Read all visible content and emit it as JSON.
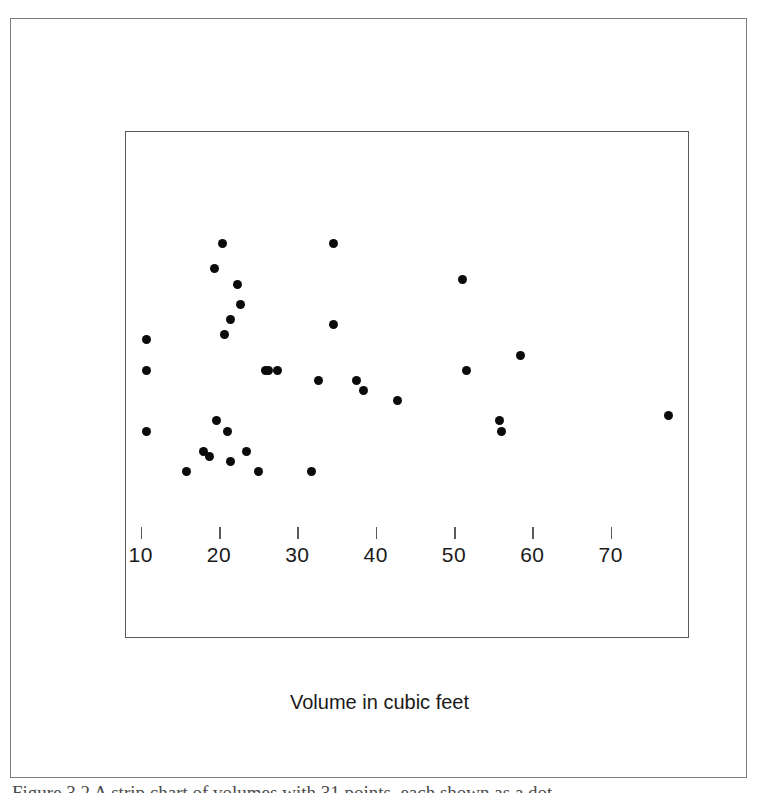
{
  "figure": {
    "caption": "Figure 3.2  A strip chart of volumes with 31 points, each shown as a dot."
  },
  "chart_data": {
    "type": "scatter",
    "title": "",
    "subtitle": "",
    "xlabel": "Volume in cubic feet",
    "ylabel": "",
    "xlim": [
      8,
      80
    ],
    "ylim": [
      0,
      1
    ],
    "grid": false,
    "legend": null,
    "xticks": [
      10,
      20,
      30,
      40,
      50,
      60,
      70
    ],
    "xticklabels": [
      "10",
      "20",
      "30",
      "40",
      "50",
      "60",
      "70"
    ],
    "yticks": [],
    "yticklabels": [],
    "marker": "filled-circle",
    "marker_color": "#0b0b0b",
    "marker_size_px": 9,
    "point_count": 31,
    "x": [
      10.6,
      10.6,
      10.6,
      15.7,
      17.9,
      18.7,
      19.3,
      19.6,
      20.3,
      20.6,
      21.0,
      21.4,
      21.4,
      22.2,
      22.6,
      23.4,
      24.9,
      25.8,
      26.2,
      27.4,
      31.7,
      32.6,
      34.5,
      34.5,
      37.4,
      38.3,
      42.6,
      51.0,
      51.5,
      55.7,
      55.9,
      58.3,
      77.3
    ],
    "jitter_y": [
      0.59,
      0.53,
      0.41,
      0.33,
      0.37,
      0.36,
      0.73,
      0.43,
      0.78,
      0.6,
      0.41,
      0.35,
      0.63,
      0.7,
      0.66,
      0.37,
      0.33,
      0.53,
      0.53,
      0.53,
      0.33,
      0.51,
      0.78,
      0.62,
      0.51,
      0.49,
      0.47,
      0.71,
      0.53,
      0.43,
      0.41,
      0.56,
      0.44
    ],
    "points": [
      {
        "x": 10.6,
        "y": 0.59
      },
      {
        "x": 10.6,
        "y": 0.53
      },
      {
        "x": 10.6,
        "y": 0.41
      },
      {
        "x": 15.7,
        "y": 0.33
      },
      {
        "x": 17.9,
        "y": 0.37
      },
      {
        "x": 18.7,
        "y": 0.36
      },
      {
        "x": 19.3,
        "y": 0.73
      },
      {
        "x": 19.6,
        "y": 0.43
      },
      {
        "x": 20.3,
        "y": 0.78
      },
      {
        "x": 20.6,
        "y": 0.6
      },
      {
        "x": 21.0,
        "y": 0.41
      },
      {
        "x": 21.4,
        "y": 0.35
      },
      {
        "x": 21.4,
        "y": 0.63
      },
      {
        "x": 22.2,
        "y": 0.7
      },
      {
        "x": 22.6,
        "y": 0.66
      },
      {
        "x": 23.4,
        "y": 0.37
      },
      {
        "x": 24.9,
        "y": 0.33
      },
      {
        "x": 25.8,
        "y": 0.53
      },
      {
        "x": 26.2,
        "y": 0.53
      },
      {
        "x": 27.4,
        "y": 0.53
      },
      {
        "x": 31.7,
        "y": 0.33
      },
      {
        "x": 32.6,
        "y": 0.51
      },
      {
        "x": 34.5,
        "y": 0.78
      },
      {
        "x": 34.5,
        "y": 0.62
      },
      {
        "x": 37.4,
        "y": 0.51
      },
      {
        "x": 38.3,
        "y": 0.49
      },
      {
        "x": 42.6,
        "y": 0.47
      },
      {
        "x": 51.0,
        "y": 0.71
      },
      {
        "x": 51.5,
        "y": 0.53
      },
      {
        "x": 55.7,
        "y": 0.43
      },
      {
        "x": 55.9,
        "y": 0.41
      },
      {
        "x": 58.3,
        "y": 0.56
      },
      {
        "x": 77.3,
        "y": 0.44
      }
    ]
  },
  "style": {
    "point_color": "#0b0b0b",
    "axis_color": "#5a5a5a",
    "frame_color": "#7d7d7d",
    "text_color": "#1a1a1a",
    "background": "#ffffff"
  }
}
